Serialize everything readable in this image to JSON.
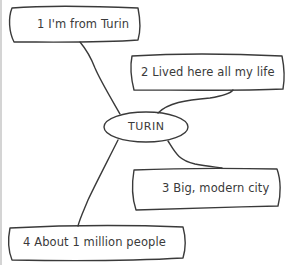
{
  "diagram": {
    "type": "mind-map",
    "center": {
      "label": "TURIN"
    },
    "nodes": [
      {
        "number": "1",
        "text": "I'm from Turin",
        "label": "1 I'm from Turin"
      },
      {
        "number": "2",
        "text": "Lived here all my life",
        "label": "2 Lived here all my life"
      },
      {
        "number": "3",
        "text": "Big, modern city",
        "label": "3 Big, modern city"
      },
      {
        "number": "4",
        "text": "About 1 million people",
        "label": "4 About 1 million people"
      }
    ],
    "colors": {
      "stroke": "#3a3a3a",
      "text": "#3a3a3a",
      "background": "#ffffff",
      "edge_rule": "#d4d4d4"
    }
  }
}
